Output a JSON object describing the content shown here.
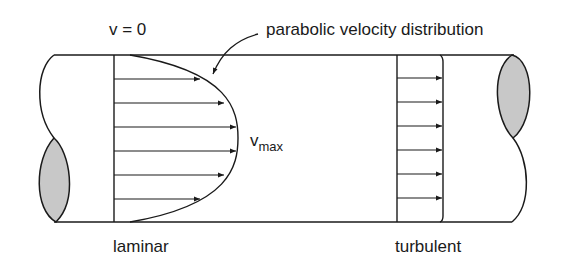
{
  "diagram": {
    "labels": {
      "v_zero": "v = 0",
      "parabolic": "parabolic velocity distribution",
      "vmax_main": "v",
      "vmax_sub": "max",
      "laminar": "laminar",
      "turbulent": "turbulent"
    },
    "colors": {
      "stroke": "#1a1a1a",
      "cut_fill": "#c8c8c8"
    },
    "laminar_profile": {
      "type": "parabolic",
      "arrow_count": 6
    },
    "turbulent_profile": {
      "type": "flat",
      "arrow_count": 6
    }
  }
}
